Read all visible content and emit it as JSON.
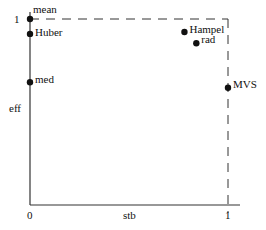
{
  "chart_data": {
    "type": "scatter",
    "title": "",
    "xlabel": "stb",
    "ylabel": "eff",
    "xlim": [
      0,
      1
    ],
    "ylim": [
      0,
      1
    ],
    "x_ticks": [
      "0",
      "1"
    ],
    "y_ticks": [
      "1"
    ],
    "grid": false,
    "legend": null,
    "reference_lines": [
      {
        "type": "horizontal-dashed",
        "y": 1,
        "x_from": 0,
        "x_to": 1
      },
      {
        "type": "vertical-dashed",
        "x": 1,
        "y_from": 0,
        "y_to": 1
      }
    ],
    "points": [
      {
        "label": "mean",
        "x": 0.0,
        "y": 1.0
      },
      {
        "label": "Huber",
        "x": 0.0,
        "y": 0.92
      },
      {
        "label": "med",
        "x": 0.0,
        "y": 0.66
      },
      {
        "label": "Hampel",
        "x": 0.78,
        "y": 0.93
      },
      {
        "label": "rad",
        "x": 0.84,
        "y": 0.87
      },
      {
        "label": "MVS",
        "x": 1.0,
        "y": 0.63
      }
    ]
  },
  "axes": {
    "x_label": "stb",
    "y_label": "eff",
    "x_tick_0": "0",
    "x_tick_1": "1",
    "y_tick_1": "1"
  },
  "colors": {
    "axis": "#333333",
    "point": "#111111",
    "dashed": "#333333"
  }
}
